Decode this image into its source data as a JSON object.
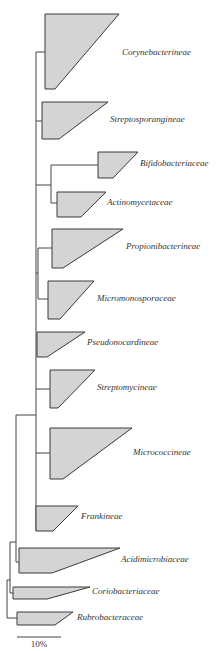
{
  "figure": {
    "type": "phylogenetic-tree",
    "colors": {
      "clade_fill": "#d4d4d4",
      "clade_stroke": "#3a3a3a",
      "branch": "#444444",
      "text": "#333333"
    },
    "scale_bar": {
      "label": "10%",
      "x1": 17,
      "x2": 61,
      "y": 637,
      "label_x": 39,
      "label_y": 647
    }
  },
  "clades": [
    {
      "name": "Corynebacterineae",
      "points": "45,14 119,14 55,89 45,89",
      "label_x": 122,
      "label_y": 55
    },
    {
      "name": "Streptosporangineae",
      "points": "42,102 108,102 59,139 42,139",
      "label_x": 110,
      "label_y": 122
    },
    {
      "name": "Bifidobacteriaceae",
      "points": "98,152 138,152 113,178 98,178",
      "label_x": 140,
      "label_y": 166
    },
    {
      "name": "Actinomycetaceae",
      "points": "57,192 106,192 81,217 57,217",
      "label_x": 107,
      "label_y": 205
    },
    {
      "name": "Propionibacterineae",
      "points": "52,229 123,229 63,268 52,268",
      "label_x": 126,
      "label_y": 249
    },
    {
      "name": "Micromonosporaceae",
      "points": "48,281 94,281 60,319 48,319",
      "label_x": 97,
      "label_y": 301
    },
    {
      "name": "Pseudonocardineae",
      "points": "37,332 85,332 47,357 37,357",
      "label_x": 87,
      "label_y": 345
    },
    {
      "name": "Streptomycineae",
      "points": "50,370 95,370 58,408 50,408",
      "label_x": 97,
      "label_y": 390
    },
    {
      "name": "Micrococcineae",
      "points": "50,428 132,428 63,479 50,479",
      "label_x": 133,
      "label_y": 455
    },
    {
      "name": "Frankineae",
      "points": "36,506 78,506 53,531 36,531",
      "label_x": 81,
      "label_y": 519
    },
    {
      "name": "Acidimicrobiaceae",
      "points": "19,548 120,548 52,573 19,573",
      "label_x": 121,
      "label_y": 562
    },
    {
      "name": "Coriobacteriaceae",
      "points": "13,587 90,587 47,599 13,599",
      "label_x": 92,
      "label_y": 594
    },
    {
      "name": "Rubrobacteraceae",
      "points": "17,612 73,612 55,625 17,625",
      "label_x": 77,
      "label_y": 620
    }
  ],
  "branches": [
    {
      "d": "M36,52 L36,531"
    },
    {
      "d": "M36,52 L45,52"
    },
    {
      "d": "M36,121 L42,121"
    },
    {
      "d": "M36,185 L51,185"
    },
    {
      "d": "M51,165 L51,203"
    },
    {
      "d": "M51,165 L98,165"
    },
    {
      "d": "M51,203 L57,203"
    },
    {
      "d": "M36,273 L38,273"
    },
    {
      "d": "M38,248 L38,299"
    },
    {
      "d": "M38,248 L52,248"
    },
    {
      "d": "M38,299 L48,299"
    },
    {
      "d": "M36,389 L50,389"
    },
    {
      "d": "M36,453 L50,453"
    },
    {
      "d": "M16,415 L36,415"
    },
    {
      "d": "M16,415 L16,562"
    },
    {
      "d": "M16,562 L19,562"
    },
    {
      "d": "M10,542 L16,542"
    },
    {
      "d": "M10,542 L10,593"
    },
    {
      "d": "M10,593 L13,593"
    },
    {
      "d": "M7,580 L10,580"
    },
    {
      "d": "M7,580 L7,618"
    },
    {
      "d": "M7,618 L17,618"
    }
  ]
}
